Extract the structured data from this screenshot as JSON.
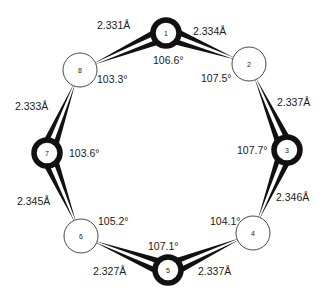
{
  "diagram": {
    "type": "ring-structure",
    "atoms": [
      {
        "id": "1",
        "x": 166,
        "y": 33,
        "r": 13,
        "style": "bold"
      },
      {
        "id": "2",
        "x": 249,
        "y": 64,
        "r": 17,
        "style": "thin"
      },
      {
        "id": "3",
        "x": 287,
        "y": 150,
        "r": 13,
        "style": "bold"
      },
      {
        "id": "4",
        "x": 253,
        "y": 233,
        "r": 17,
        "style": "thin"
      },
      {
        "id": "5",
        "x": 168,
        "y": 270,
        "r": 13,
        "style": "bold"
      },
      {
        "id": "6",
        "x": 81,
        "y": 236,
        "r": 17,
        "style": "thin"
      },
      {
        "id": "7",
        "x": 47,
        "y": 153,
        "r": 13,
        "style": "bold"
      },
      {
        "id": "8",
        "x": 80,
        "y": 70,
        "r": 17,
        "style": "thin"
      }
    ],
    "bonds": [
      {
        "from": "1",
        "to": "8",
        "length": "2.331Å",
        "lx": 97,
        "ly": 29
      },
      {
        "from": "1",
        "to": "2",
        "length": "2.334Å",
        "lx": 193,
        "ly": 35
      },
      {
        "from": "3",
        "to": "2",
        "length": "2.337Å",
        "lx": 277,
        "ly": 106
      },
      {
        "from": "3",
        "to": "4",
        "length": "2.346Å",
        "lx": 276,
        "ly": 201
      },
      {
        "from": "5",
        "to": "4",
        "length": "2.337Å",
        "lx": 198,
        "ly": 275
      },
      {
        "from": "5",
        "to": "6",
        "length": "2.327Å",
        "lx": 93,
        "ly": 275
      },
      {
        "from": "7",
        "to": "6",
        "length": "2.345Å",
        "lx": 17,
        "ly": 205
      },
      {
        "from": "7",
        "to": "8",
        "length": "2.333Å",
        "lx": 15,
        "ly": 110
      }
    ],
    "angles": [
      {
        "atom": "1",
        "value": "106.6°",
        "x": 153,
        "y": 64
      },
      {
        "atom": "2",
        "value": "107.5°",
        "x": 201,
        "y": 82
      },
      {
        "atom": "3",
        "value": "107.7°",
        "x": 237,
        "y": 154
      },
      {
        "atom": "4",
        "value": "104.1°",
        "x": 210,
        "y": 225
      },
      {
        "atom": "5",
        "value": "107.1°",
        "x": 148,
        "y": 250
      },
      {
        "atom": "6",
        "value": "105.2°",
        "x": 98,
        "y": 225
      },
      {
        "atom": "7",
        "value": "103.6°",
        "x": 69,
        "y": 157
      },
      {
        "atom": "8",
        "value": "103.3°",
        "x": 97,
        "y": 83
      }
    ]
  }
}
